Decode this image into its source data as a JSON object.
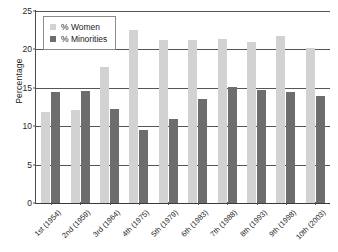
{
  "chart_data": {
    "type": "bar",
    "title": "",
    "xlabel": "",
    "ylabel": "Percentage",
    "ylim": [
      0,
      25
    ],
    "yticks": [
      0,
      5,
      10,
      15,
      20,
      25
    ],
    "grid": true,
    "legend_position": "top-left",
    "categories": [
      "1st (1954)",
      "2nd (1959)",
      "3rd (1964)",
      "4th (1975)",
      "5th (1979)",
      "6th (1983)",
      "7th (1988)",
      "8th (1993)",
      "9th (1998)",
      "10th (2003)"
    ],
    "series": [
      {
        "name": "% Women",
        "color": "#d2d2d2",
        "values": [
          11.8,
          12.1,
          17.7,
          22.5,
          21.2,
          21.2,
          21.3,
          21.0,
          21.8,
          20.2
        ]
      },
      {
        "name": "% Minorities",
        "color": "#6d6d6d",
        "values": [
          14.5,
          14.6,
          12.2,
          9.5,
          10.9,
          13.6,
          15.1,
          14.7,
          14.5,
          13.9
        ]
      }
    ]
  },
  "legend": {
    "items": [
      {
        "label": "% Women",
        "swatch": "legend-swatch-women"
      },
      {
        "label": "% Minorities",
        "swatch": "legend-swatch-minorities"
      }
    ]
  },
  "axes": {
    "y_title": "Percentage"
  }
}
